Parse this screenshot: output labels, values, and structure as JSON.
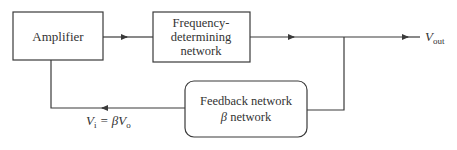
{
  "blocks": {
    "amplifier": {
      "label": "Amplifier"
    },
    "frequency": {
      "line1": "Frequency-",
      "line2": "determining",
      "line3": "network"
    },
    "feedback": {
      "line1": "Feedback network",
      "beta": "β",
      "line2_rest": " network"
    }
  },
  "labels": {
    "vout_v": "V",
    "vout_sub": "out",
    "vi_v": "V",
    "vi_sub": "i",
    "vi_eq": " = β",
    "vi_v2": "V",
    "vi_sub2": "o"
  },
  "colors": {
    "stroke": "#3a3a3a",
    "text": "#333333",
    "background": "#ffffff"
  }
}
